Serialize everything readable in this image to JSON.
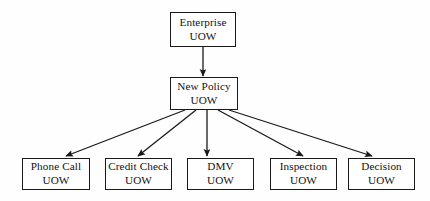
{
  "diagram": {
    "background_color": "#fefefe",
    "line_color": "#1a1a1a",
    "text_color": "#121212",
    "nodes": [
      {
        "id": "enterprise",
        "label_line1": "Enterprise",
        "label_line2": "UOW",
        "x": 170,
        "y": 12,
        "w": 66,
        "h": 35
      },
      {
        "id": "new-policy",
        "label_line1": "New Policy",
        "label_line2": "UOW",
        "x": 170,
        "y": 77,
        "w": 68,
        "h": 33
      },
      {
        "id": "phone-call",
        "label_line1": "Phone Call",
        "label_line2": "UOW",
        "x": 22,
        "y": 158,
        "w": 68,
        "h": 32
      },
      {
        "id": "credit-check",
        "label_line1": "Credit Check",
        "label_line2": "UOW",
        "x": 105,
        "y": 158,
        "w": 67,
        "h": 32
      },
      {
        "id": "dmv",
        "label_line1": "DMV",
        "label_line2": "UOW",
        "x": 187,
        "y": 158,
        "w": 67,
        "h": 32
      },
      {
        "id": "inspection",
        "label_line1": "Inspection",
        "label_line2": "UOW",
        "x": 270,
        "y": 158,
        "w": 67,
        "h": 32
      },
      {
        "id": "decision",
        "label_line1": "Decision",
        "label_line2": "UOW",
        "x": 348,
        "y": 158,
        "w": 67,
        "h": 32
      }
    ],
    "edges": [
      {
        "id": "enterprise-to-new-policy",
        "from": "enterprise",
        "to": "new-policy",
        "x1": 203,
        "y1": 47,
        "x2": 203,
        "y2": 76
      },
      {
        "id": "new-policy-to-phone-call",
        "from": "new-policy",
        "to": "phone-call",
        "x1": 185,
        "y1": 110,
        "x2": 66,
        "y2": 156
      },
      {
        "id": "new-policy-to-credit-check",
        "from": "new-policy",
        "to": "credit-check",
        "x1": 196,
        "y1": 110,
        "x2": 138,
        "y2": 156
      },
      {
        "id": "new-policy-to-dmv",
        "from": "new-policy",
        "to": "dmv",
        "x1": 207,
        "y1": 110,
        "x2": 207,
        "y2": 156
      },
      {
        "id": "new-policy-to-inspection",
        "from": "new-policy",
        "to": "inspection",
        "x1": 218,
        "y1": 110,
        "x2": 303,
        "y2": 156
      },
      {
        "id": "new-policy-to-decision",
        "from": "new-policy",
        "to": "decision",
        "x1": 229,
        "y1": 110,
        "x2": 372,
        "y2": 156
      }
    ]
  }
}
